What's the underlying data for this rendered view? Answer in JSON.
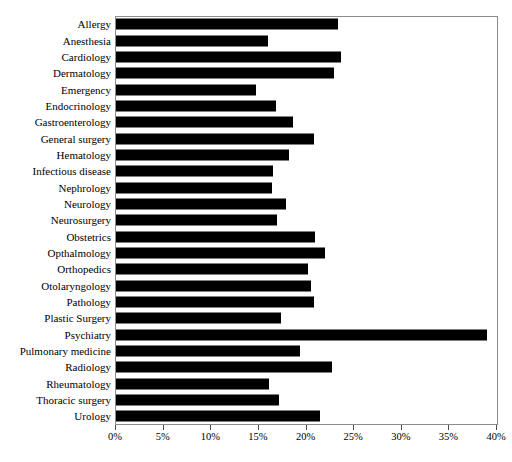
{
  "chart_data": {
    "type": "bar",
    "orientation": "horizontal",
    "title": "",
    "subtitle": "",
    "xlabel": "",
    "ylabel": "",
    "xlim": [
      0,
      40
    ],
    "x_tick_labels": [
      "0%",
      "5%",
      "10%",
      "15%",
      "20%",
      "25%",
      "30%",
      "35%",
      "40%"
    ],
    "x_ticks": [
      0,
      5,
      10,
      15,
      20,
      25,
      30,
      35,
      40
    ],
    "grid": false,
    "legend": null,
    "bar_color": "#000000",
    "frame_color": "#8c8c8c",
    "categories": [
      "Allergy",
      "Anesthesia",
      "Cardiology",
      "Dermatology",
      "Emergency",
      "Endocrinology",
      "Gastroenterology",
      "General surgery",
      "Hematology",
      "Infectious disease",
      "Nephrology",
      "Neurology",
      "Neurosurgery",
      "Obstetrics",
      "Opthalmology",
      "Orthopedics",
      "Otolaryngology",
      "Pathology",
      "Plastic Surgery",
      "Psychiatry",
      "Pulmonary medicine",
      "Radiology",
      "Rheumatology",
      "Thoracic surgery",
      "Urology"
    ],
    "values": [
      23.3,
      16.0,
      23.6,
      22.9,
      14.7,
      16.8,
      18.6,
      20.8,
      18.2,
      16.5,
      16.4,
      17.8,
      16.9,
      20.9,
      21.9,
      20.2,
      20.5,
      20.8,
      17.3,
      39.0,
      19.3,
      22.7,
      16.1,
      17.1,
      21.4
    ]
  }
}
